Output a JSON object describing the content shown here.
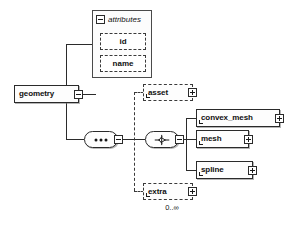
{
  "diagram": {
    "type": "xsd-schema-tree",
    "root": {
      "name": "geometry",
      "expander": "minus-box",
      "occurrence": ""
    },
    "attributes_group": {
      "title": "attributes",
      "expander": "minus-box",
      "items": [
        {
          "name": "id",
          "optional": true
        },
        {
          "name": "name",
          "optional": true
        }
      ]
    },
    "compositors": {
      "sequence": {
        "icon": "sequence-dots",
        "expander": "minus-box"
      },
      "choice": {
        "icon": "choice-switch",
        "expander": "minus-box"
      }
    },
    "optional_elements": [
      {
        "name": "asset",
        "expander": "plus-box",
        "occurrence": ""
      },
      {
        "name": "extra",
        "expander": "plus-box",
        "occurrence": "0..∞"
      }
    ],
    "choice_children": [
      {
        "name": "convex_mesh",
        "expander": "plus-box"
      },
      {
        "name": "mesh",
        "expander": "plus-box"
      },
      {
        "name": "spline",
        "expander": "plus-box"
      }
    ],
    "colors": {
      "line": "#2b2b2b",
      "dashed_line": "#3a3a3a",
      "box_border": "#2a2a2a",
      "box_fill": "#fdfdfd",
      "text": "#101010",
      "background": "#ffffff"
    }
  }
}
